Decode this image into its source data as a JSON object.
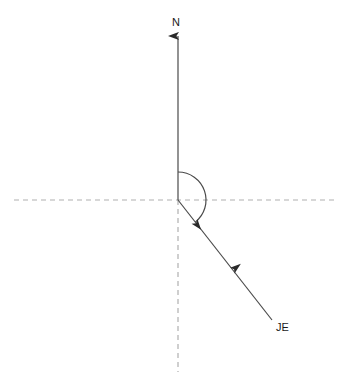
{
  "diagram": {
    "background_color": "#ffffff",
    "stroke_color": "#3a3a3a",
    "dashed_color": "#b0b0b0",
    "text_color": "#1a1a1a",
    "origin": {
      "x": 178,
      "y": 200
    },
    "north_axis": {
      "label": "N",
      "label_x": 172,
      "label_y": 26,
      "line_start": {
        "x": 178,
        "y": 200
      },
      "line_end": {
        "x": 178,
        "y": 30
      },
      "arrowhead": "up"
    },
    "bearing_ray": {
      "label": "JE",
      "label_x": 276,
      "label_y": 331,
      "line_start": {
        "x": 178,
        "y": 200
      },
      "line_end": {
        "x": 272,
        "y": 320
      },
      "midpoint_arrowhead": {
        "x": 232,
        "y": 269
      },
      "arrowhead": "down-right"
    },
    "horizontal_dashed_line": {
      "x_start": 14,
      "x_end": 338,
      "y": 200,
      "dash_pattern": "5,4"
    },
    "vertical_dashed_line": {
      "x": 178,
      "y_start": 200,
      "y_end": 372,
      "dash_pattern": "5,4"
    },
    "bearing_arc": {
      "radius": 28,
      "start_angle_deg": 0,
      "sweep_angle_deg": 142,
      "direction": "clockwise",
      "arrowhead": "end"
    }
  }
}
